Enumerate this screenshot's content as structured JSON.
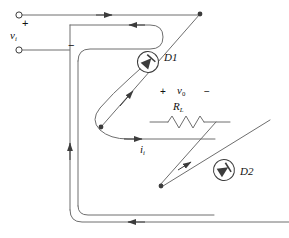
{
  "diagram": {
    "type": "circuit-schematic",
    "background_color": "#ffffff",
    "line_color": "#3c3c3c",
    "text_color": "#111111"
  },
  "labels": {
    "input_plus": "+",
    "input_minus": "−",
    "input_voltage": "v",
    "input_voltage_sub": "i",
    "output_plus": "+",
    "output_minus": "−",
    "output_voltage": "v",
    "output_voltage_sub": "0",
    "load_resistor": "R",
    "load_resistor_sub": "L",
    "input_current": "i",
    "input_current_sub": "i",
    "diode_1": "D1",
    "diode_2": "D2"
  },
  "components": [
    {
      "name": "input-terminal-top",
      "kind": "terminal",
      "label": "+"
    },
    {
      "name": "input-terminal-bottom",
      "kind": "terminal",
      "label": "−"
    },
    {
      "name": "diode-d1",
      "kind": "diode",
      "label": "D1"
    },
    {
      "name": "diode-d2",
      "kind": "diode",
      "label": "D2"
    },
    {
      "name": "load-resistor",
      "kind": "resistor",
      "label": "RL"
    }
  ],
  "current_arrows": [
    {
      "name": "arrow-top-wire",
      "direction": "right"
    },
    {
      "name": "arrow-top-return",
      "direction": "left"
    },
    {
      "name": "arrow-left-vertical",
      "direction": "up"
    },
    {
      "name": "arrow-bottom-wire",
      "direction": "left"
    },
    {
      "name": "arrow-d1-diagonal",
      "direction": "up-right"
    },
    {
      "name": "arrow-d2-diagonal",
      "direction": "up-right"
    },
    {
      "name": "arrow-load-input",
      "direction": "right"
    }
  ]
}
